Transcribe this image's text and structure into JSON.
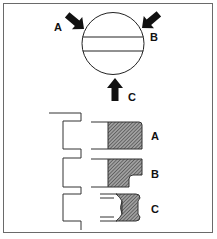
{
  "figure": {
    "type": "technical-diagram",
    "colors": {
      "line": "#222222",
      "frame": "#6a6a6a",
      "hatch_fill": "#8a8a8a",
      "background": "#ffffff"
    }
  },
  "top_view": {
    "arrows": [
      {
        "label": "A",
        "direction": "down-right"
      },
      {
        "label": "B",
        "direction": "down-left"
      },
      {
        "label": "C",
        "direction": "up"
      }
    ]
  },
  "profiles": [
    {
      "label": "A",
      "shape": "rectangular"
    },
    {
      "label": "B",
      "shape": "stepped"
    },
    {
      "label": "C",
      "shape": "concave"
    }
  ]
}
